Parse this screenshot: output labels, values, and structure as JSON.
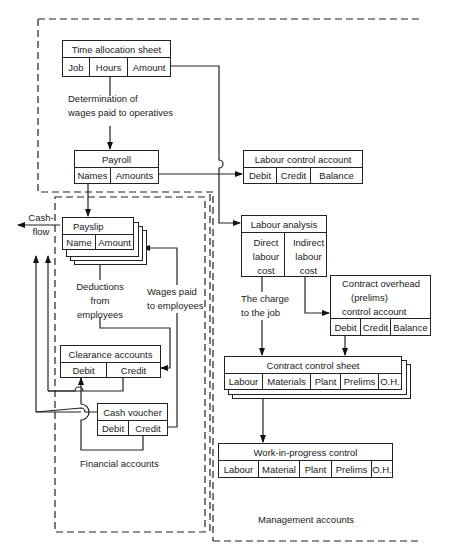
{
  "diagram": {
    "regions": {
      "management": "Management accounts",
      "financial": "Financial accounts"
    },
    "nodes": {
      "time_allocation": {
        "title": "Time allocation sheet",
        "cells": [
          "Job",
          "Hours",
          "Amount"
        ]
      },
      "payroll": {
        "title": "Payroll",
        "cells": [
          "Names",
          "Amounts"
        ]
      },
      "labour_control": {
        "title": "Labour control account",
        "cells": [
          "Debit",
          "Credit",
          "Balance"
        ]
      },
      "payslip": {
        "title": "Payslip",
        "cells": [
          "Name",
          "Amount"
        ]
      },
      "labour_analysis": {
        "title": "Labour analysis",
        "cells": [
          "Direct labour cost",
          "Indirect labour cost"
        ],
        "cell_lines": [
          [
            "Direct",
            "labour",
            "cost"
          ],
          [
            "Indirect",
            "labour",
            "cost"
          ]
        ]
      },
      "contract_overhead": {
        "title_lines": [
          "Contract overhead",
          "(prelims)",
          "control account"
        ],
        "cells": [
          "Debit",
          "Credit",
          "Balance"
        ]
      },
      "contract_control": {
        "title": "Contract control sheet",
        "cells": [
          "Labour",
          "Materials",
          "Plant",
          "Prelims",
          "O.H."
        ]
      },
      "wip_control": {
        "title": "Work-in-progress control",
        "cells": [
          "Labour",
          "Material",
          "Plant",
          "Prelims",
          "O.H."
        ]
      },
      "clearance": {
        "title": "Clearance accounts",
        "cells": [
          "Debit",
          "Credit"
        ]
      },
      "cash_voucher": {
        "title": "Cash voucher",
        "cells": [
          "Debit",
          "Credit"
        ]
      }
    },
    "edge_labels": {
      "determination": [
        "Determination of",
        "wages paid to operatives"
      ],
      "cash_flow": [
        "Cash-",
        "flow"
      ],
      "deductions": [
        "Deductions",
        "from",
        "employees"
      ],
      "wages_paid": [
        "Wages paid",
        "to employees"
      ],
      "charge_to_job": [
        "The charge",
        "to the job"
      ]
    }
  }
}
